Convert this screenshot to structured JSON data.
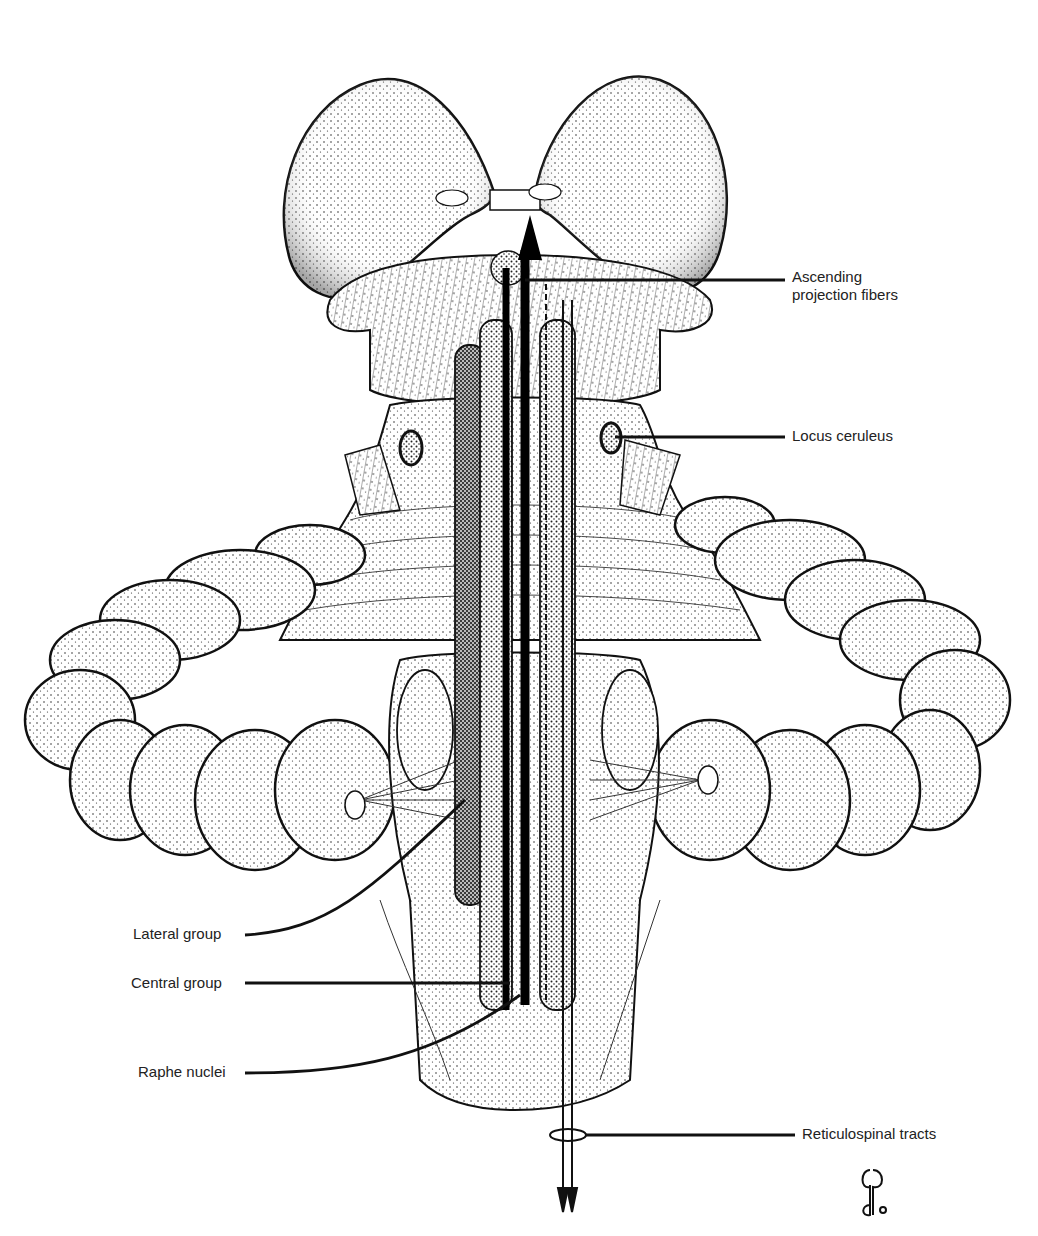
{
  "figure": {
    "colors": {
      "ink": "#111111",
      "paper": "#ffffff",
      "stipple": "#555555"
    }
  },
  "labels": {
    "ascending": "Ascending\nprojection fibers",
    "locus": "Locus ceruleus",
    "lateral": "Lateral group",
    "central": "Central group",
    "raphe": "Raphe nuclei",
    "reticulospinal": "Reticulospinal tracts"
  },
  "signature": {
    "icon": "artist-monogram-icon"
  }
}
